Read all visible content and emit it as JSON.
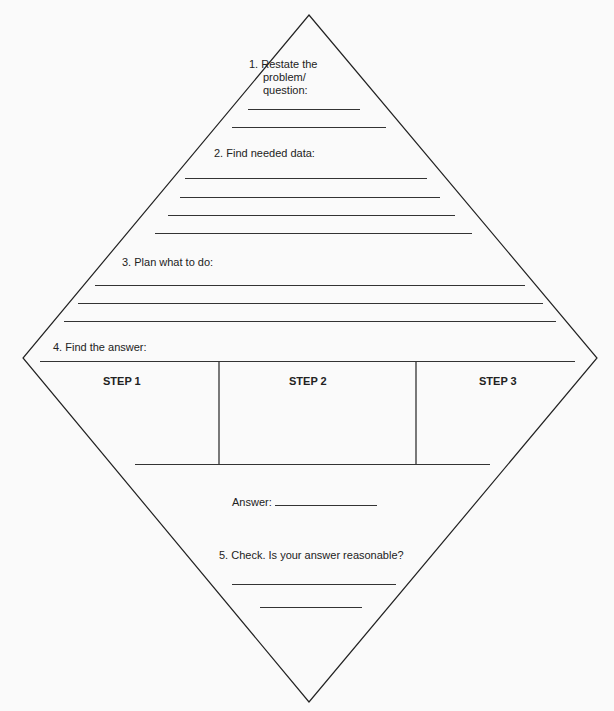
{
  "worksheet": {
    "sections": {
      "restate": {
        "line1": "1.  Restate the",
        "line2": "problem/",
        "line3": "question:"
      },
      "find_data": {
        "label": "2.  Find needed data:"
      },
      "plan": {
        "label": "3.  Plan what to do:"
      },
      "find_answer": {
        "label": "4.  Find the answer:"
      },
      "steps": [
        "STEP 1",
        "STEP 2",
        "STEP 3"
      ],
      "answer": {
        "label": "Answer:"
      },
      "check": {
        "label": "5.  Check. Is your answer reasonable?"
      }
    },
    "colors": {
      "ink": "#222222",
      "paper": "#fafafa"
    }
  }
}
